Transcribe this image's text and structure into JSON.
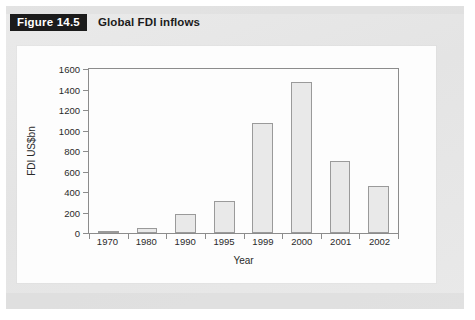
{
  "figure": {
    "tag": "Figure 14.5",
    "title": "Global FDI inflows"
  },
  "chart_data": {
    "type": "bar",
    "title": "Global FDI inflows",
    "categories": [
      "1970",
      "1980",
      "1990",
      "1995",
      "1999",
      "2000",
      "2001",
      "2002"
    ],
    "values": [
      15,
      50,
      185,
      315,
      1070,
      1470,
      700,
      460
    ],
    "xlabel": "Year",
    "ylabel": "FDI US$bn",
    "ylim": [
      0,
      1600
    ],
    "yticks": [
      "0",
      "200",
      "400",
      "600",
      "800",
      "1000",
      "1200",
      "1400",
      "1600"
    ],
    "grid": false,
    "legend": null,
    "bar_fill": "#e9e9e9",
    "bar_border": "#9a9a9a",
    "axis_color": "#8c8c8c"
  }
}
